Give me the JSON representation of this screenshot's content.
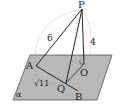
{
  "diagram": {
    "plane_label": "α",
    "points": {
      "P": "P",
      "A": "A",
      "O": "O",
      "Q": "Q",
      "B": "B"
    },
    "edge_labels": {
      "PA": "6",
      "PO": "4",
      "AQ": "√11"
    },
    "colors": {
      "plane_fill": "#b3b3b3",
      "plane_stroke": "#555555",
      "line": "#222222",
      "dashed": "#999999"
    }
  }
}
